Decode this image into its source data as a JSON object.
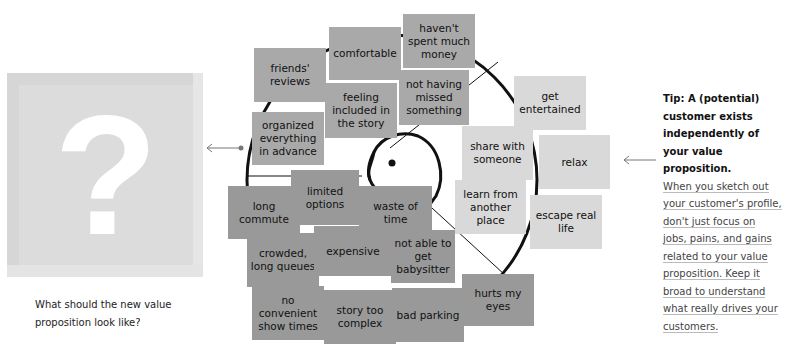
{
  "left_panel": {
    "icon": "question-mark-icon",
    "question_glyph": "?",
    "question_text": "What should the new value proposition look like?"
  },
  "customer_profile": {
    "gains": [
      {
        "label": "friends' reviews"
      },
      {
        "label": "comfortable"
      },
      {
        "label": "haven't spent much money"
      },
      {
        "label": "feeling included in the story"
      },
      {
        "label": "not having missed something"
      },
      {
        "label": "organized everything in advance"
      }
    ],
    "pains": [
      {
        "label": "long commute"
      },
      {
        "label": "limited options"
      },
      {
        "label": "waste of time"
      },
      {
        "label": "crowded, long queues"
      },
      {
        "label": "expensive"
      },
      {
        "label": "not able to get babysitter"
      },
      {
        "label": "no convenient show times"
      },
      {
        "label": "story too complex"
      },
      {
        "label": "bad parking"
      },
      {
        "label": "hurts my eyes"
      }
    ],
    "jobs": [
      {
        "label": "get entertained"
      },
      {
        "label": "share with someone"
      },
      {
        "label": "relax"
      },
      {
        "label": "learn from another place"
      },
      {
        "label": "escape real life"
      }
    ],
    "colors": {
      "gain": "#a9a9a9",
      "pain": "#999999",
      "job": "#d9d9d9",
      "outline": "#111111"
    }
  },
  "tip": {
    "heading": "Tip: A (potential) customer exists independently of your value proposition.",
    "body_lines": [
      "When you sketch out",
      "your customer's profile,",
      "don't just focus on",
      "jobs, pains, and gains",
      "related to your value",
      "proposition. Keep it",
      "broad to understand",
      "what really drives your",
      "customers."
    ]
  }
}
